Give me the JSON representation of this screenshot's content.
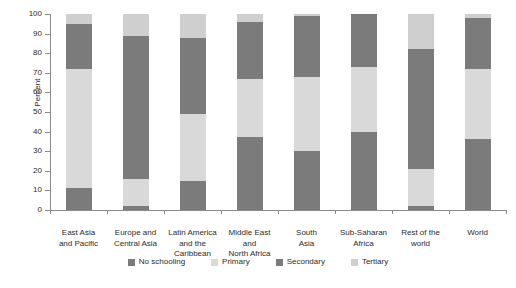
{
  "chart_data": {
    "type": "bar",
    "subtype": "stacked-bar-100-percent",
    "title": "",
    "xlabel": "",
    "ylabel": "Percent",
    "ylim": [
      0,
      100
    ],
    "yticks": [
      0,
      10,
      20,
      30,
      40,
      50,
      60,
      70,
      80,
      90,
      100
    ],
    "grid": false,
    "legend_position": "bottom",
    "categories": [
      "East Asia and Pacific",
      "Europe and Central Asia",
      "Latin America and the Caribbean",
      "Middle East and North Africa",
      "South Asia",
      "Sub-Saharan Africa",
      "Rest of the world",
      "World"
    ],
    "category_lines": [
      [
        "East Asia",
        "and Pacific"
      ],
      [
        "Europe and",
        "Central Asia"
      ],
      [
        "Latin America",
        "and the",
        "Caribbean"
      ],
      [
        "Middle East",
        "and",
        "North Africa"
      ],
      [
        "South",
        "Asia"
      ],
      [
        "Sub-Saharan",
        "Africa"
      ],
      [
        "Rest of the",
        "world"
      ],
      [
        "World"
      ]
    ],
    "series": [
      {
        "name": "No schooling",
        "color": "#7b7b7b",
        "values": [
          11,
          2,
          15,
          37,
          30,
          40,
          2,
          36
        ]
      },
      {
        "name": "Primary",
        "color": "#d9d9d9",
        "values": [
          61,
          14,
          34,
          30,
          38,
          33,
          19,
          36
        ]
      },
      {
        "name": "Secondary",
        "color": "#7b7b7b",
        "values": [
          23,
          73,
          39,
          29,
          31,
          27,
          61,
          26
        ]
      },
      {
        "name": "Tertiary",
        "color": "#cfcfcf",
        "values": [
          5,
          11,
          12,
          4,
          1,
          0,
          18,
          2
        ]
      }
    ],
    "cumulative_tops": [
      [
        11,
        72,
        95,
        100
      ],
      [
        2,
        16,
        89,
        100
      ],
      [
        15,
        49,
        88,
        100
      ],
      [
        37,
        67,
        96,
        100
      ],
      [
        30,
        68,
        99,
        100
      ],
      [
        40,
        73,
        100,
        100
      ],
      [
        2,
        21,
        82,
        100
      ],
      [
        36,
        72,
        98,
        100
      ]
    ]
  },
  "legend": {
    "items": [
      {
        "label": "No schooling",
        "color": "#7b7b7b"
      },
      {
        "label": "Primary",
        "color": "#d9d9d9"
      },
      {
        "label": "Secondary",
        "color": "#7b7b7b"
      },
      {
        "label": "Tertiary",
        "color": "#cfcfcf"
      }
    ]
  },
  "axis": {
    "y_title": "Percent",
    "y_tick_labels": [
      "0",
      "10",
      "20",
      "30",
      "40",
      "50",
      "60",
      "70",
      "80",
      "90",
      "100"
    ]
  }
}
